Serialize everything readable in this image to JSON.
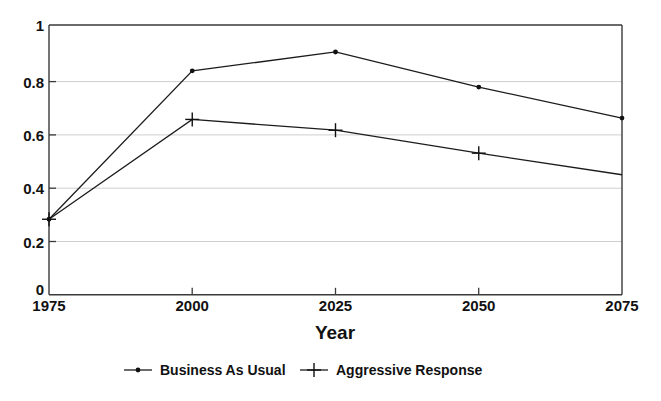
{
  "chart_data": {
    "type": "line",
    "title": "",
    "xlabel": "Year",
    "ylabel": "",
    "x": [
      1975,
      2000,
      2025,
      2050,
      2075
    ],
    "xtick_labels": [
      "1975",
      "2000",
      "2025",
      "2050",
      "2075"
    ],
    "ytick_labels": [
      "0",
      "0.2",
      "0.4",
      "0.6",
      "0.8",
      "1"
    ],
    "yticks": [
      0,
      0.2,
      0.4,
      0.6,
      0.8,
      1
    ],
    "xlim": [
      1975,
      2075
    ],
    "ylim": [
      0,
      1
    ],
    "grid": "horizontal",
    "legend_position": "bottom",
    "series": [
      {
        "name": "Business As Usual",
        "marker": "dot",
        "color": "#111111",
        "values": [
          0.28,
          0.83,
          0.9,
          0.77,
          0.655
        ]
      },
      {
        "name": "Aggressive Response",
        "marker": "plus",
        "color": "#111111",
        "values": [
          0.28,
          0.65,
          0.61,
          0.525,
          0.445
        ]
      }
    ]
  },
  "axes": {
    "x_title": "Year",
    "x_ticks": [
      "1975",
      "2000",
      "2025",
      "2050",
      "2075"
    ],
    "y_ticks": [
      "1",
      "0.8",
      "0.6",
      "0.4",
      "0.2",
      "0"
    ]
  },
  "legend": {
    "items": [
      {
        "label": "Business As Usual",
        "marker": "dot-marker-icon"
      },
      {
        "label": "Aggressive Response",
        "marker": "plus-marker-icon"
      }
    ]
  },
  "colors": {
    "line": "#111111",
    "frame": "#3a3a3a",
    "grid": "#c8c8c8",
    "background": "#ffffff"
  }
}
